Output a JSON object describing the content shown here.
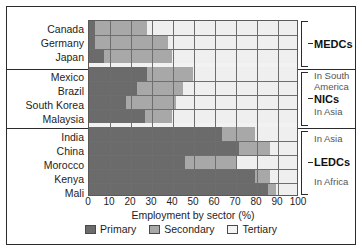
{
  "chart_data": {
    "type": "bar",
    "orientation": "horizontal",
    "stacked": true,
    "title": "",
    "xlabel": "Employment by sector (%)",
    "ylabel": "",
    "xlim": [
      0,
      100
    ],
    "grid": true,
    "legend_position": "bottom",
    "xticks": [
      "0",
      "10",
      "20",
      "30",
      "40",
      "50",
      "60",
      "70",
      "80",
      "90",
      "100"
    ],
    "categories": [
      "Canada",
      "Germany",
      "Japan",
      "Mexico",
      "Brazil",
      "South Korea",
      "Malaysia",
      "India",
      "China",
      "Morocco",
      "Kenya",
      "Mali"
    ],
    "series": [
      {
        "name": "Primary",
        "color": "#6b6b6b",
        "values": [
          3,
          3,
          7,
          28,
          23,
          18,
          27,
          64,
          72,
          46,
          80,
          86
        ]
      },
      {
        "name": "Secondary",
        "color": "#a8a8a8",
        "values": [
          25,
          35,
          33,
          22,
          22,
          24,
          13,
          16,
          15,
          25,
          7,
          4
        ]
      },
      {
        "name": "Tertiary",
        "color": "#efefef",
        "values": [
          72,
          62,
          60,
          50,
          55,
          58,
          60,
          20,
          13,
          29,
          13,
          10
        ]
      }
    ]
  },
  "groups": [
    {
      "name": "MEDCs",
      "members": [
        "Canada",
        "Germany",
        "Japan"
      ],
      "notes": []
    },
    {
      "name": "NICs",
      "members": [
        "Mexico",
        "Brazil",
        "South Korea",
        "Malaysia"
      ],
      "notes": [
        "In South",
        "America",
        "In Asia"
      ]
    },
    {
      "name": "LEDCs",
      "members": [
        "India",
        "China",
        "Morocco",
        "Kenya",
        "Mali"
      ],
      "notes": [
        "In Asia",
        "In Africa"
      ]
    }
  ],
  "legend": {
    "items": [
      {
        "label": "Primary",
        "color": "#6b6b6b"
      },
      {
        "label": "Secondary",
        "color": "#a8a8a8"
      },
      {
        "label": "Tertiary",
        "color": "#f4f4f4"
      }
    ]
  }
}
